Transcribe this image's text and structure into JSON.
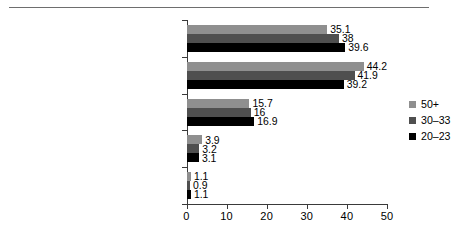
{
  "chart_data": {
    "type": "bar",
    "orientation": "horizontal",
    "title": "",
    "xlabel": "",
    "ylabel": "",
    "xlim": [
      0,
      50
    ],
    "xticks": [
      "0",
      "10",
      "20",
      "30",
      "40",
      "50"
    ],
    "grid": false,
    "legend_position": "right",
    "categories": [
      "Own the car, even if it's more expensive",
      "Own the car as long as it is not more expensive",
      "Doesn't matter/not sure",
      "Rent or lease the car as long as it is not more expensive",
      "Rent or lease the car even if it's more expensive"
    ],
    "category_lines": [
      [
        "Own the car, even if it's more",
        "expensive"
      ],
      [
        "Own the car as long as it is not",
        "more expensive"
      ],
      [
        "Doesn't matter/not sure"
      ],
      [
        "Rent or lease the car as long as it is",
        "not more expensive"
      ],
      [
        "Rent or lease the car even if it's",
        "more expensive"
      ]
    ],
    "series": [
      {
        "name": "50+",
        "color": "#8f8f8f",
        "values": [
          35.1,
          44.2,
          15.7,
          3.9,
          1.1
        ],
        "labels": [
          "35.1",
          "44.2",
          "15.7",
          "3.9",
          "1.1"
        ]
      },
      {
        "name": "30–33",
        "color": "#4f4f4f",
        "values": [
          38,
          41.9,
          16,
          3.2,
          0.9
        ],
        "labels": [
          "38",
          "41.9",
          "16",
          "3.2",
          "0.9"
        ]
      },
      {
        "name": "20–23",
        "color": "#000000",
        "values": [
          39.6,
          39.2,
          16.9,
          3.1,
          1.1
        ],
        "labels": [
          "39.6",
          "39.2",
          "16.9",
          "3.1",
          "1.1"
        ]
      }
    ]
  },
  "legend": {
    "entries": [
      {
        "label": "50+",
        "color": "#8f8f8f"
      },
      {
        "label": "30–33",
        "color": "#4f4f4f"
      },
      {
        "label": "20–23",
        "color": "#000000"
      }
    ]
  },
  "axis": {
    "x_tick_labels": [
      "0",
      "10",
      "20",
      "30",
      "40",
      "50"
    ]
  }
}
